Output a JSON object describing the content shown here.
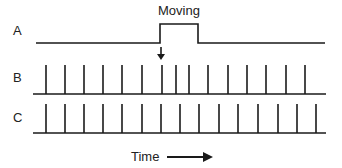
{
  "diagram": {
    "title_annotation": "Moving",
    "rows": [
      {
        "label": "A",
        "type": "step"
      },
      {
        "label": "B",
        "type": "spike-train",
        "spikes_x": [
          46,
          65,
          84,
          103,
          122,
          142,
          162,
          176,
          189,
          208,
          228,
          247,
          266,
          286,
          305
        ]
      },
      {
        "label": "C",
        "type": "spike-train",
        "spikes_x": [
          46,
          65,
          84,
          103,
          122,
          142,
          161,
          180,
          199,
          219,
          238,
          258,
          278,
          297,
          316
        ]
      }
    ],
    "step": {
      "low_y": 43,
      "high_y": 24,
      "rise_x": 160,
      "fall_x": 198,
      "start_x": 36,
      "end_x": 325
    },
    "x_axis_label": "Time",
    "colors": {
      "line": "#1a1a1a",
      "text": "#222222"
    }
  }
}
